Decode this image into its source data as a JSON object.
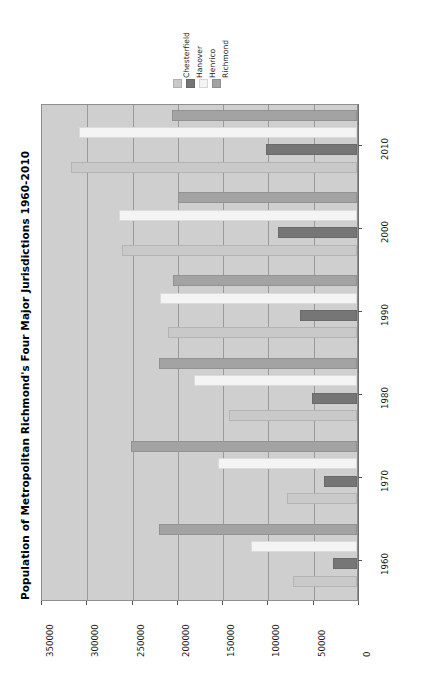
{
  "chart_data": {
    "type": "bar",
    "orientation": "horizontal",
    "title": "Population of Metropolitan Richmond's Four Major Jurisdictions 1960-2010",
    "xlabel": "",
    "ylabel": "",
    "categories": [
      "1960",
      "1970",
      "1980",
      "1990",
      "2000",
      "2010"
    ],
    "series": [
      {
        "name": "Chesterfield",
        "color": "#c9c9c9",
        "values": [
          71000,
          77000,
          141000,
          209000,
          259000,
          316000
        ]
      },
      {
        "name": "Hanover",
        "color": "#767676",
        "values": [
          27000,
          37000,
          50000,
          63000,
          87000,
          100000
        ]
      },
      {
        "name": "Henrico",
        "color": "#f4f4f4",
        "values": [
          117000,
          154000,
          180000,
          218000,
          263000,
          307000
        ]
      },
      {
        "name": "Richmond",
        "color": "#a3a3a3",
        "values": [
          219000,
          250000,
          219000,
          203000,
          198000,
          204000
        ]
      }
    ],
    "value_ticks": [
      "350000",
      "300000",
      "250000",
      "200000",
      "150000",
      "100000",
      "50000",
      "0"
    ],
    "value_tick_numbers": [
      350000,
      300000,
      250000,
      200000,
      150000,
      100000,
      50000,
      0
    ],
    "xlim": [
      0,
      350000
    ],
    "axis_reversed": true,
    "grid": true,
    "legend": {
      "position": "top",
      "entries": [
        "Chesterfield",
        "Hanover",
        "Henrico",
        "Richmond"
      ]
    },
    "plot_background": "#cfcfcf",
    "page_background": "#ffffff"
  }
}
